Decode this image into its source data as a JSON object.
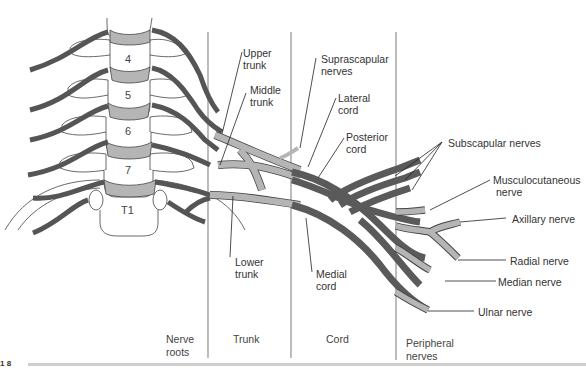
{
  "figure": {
    "number_fragment": "1  8",
    "colors": {
      "root_dark": "#555555",
      "trunk_light": "#b5b5b5",
      "cord_dark": "#5a5a5a",
      "outline": "#444444",
      "divider": "#999999"
    }
  },
  "vertebrae": [
    "4",
    "5",
    "6",
    "7",
    "T1"
  ],
  "columns": [
    {
      "line1": "Nerve",
      "line2": "roots"
    },
    {
      "line1": "Trunk",
      "line2": ""
    },
    {
      "line1": "Cord",
      "line2": ""
    },
    {
      "line1": "Peripheral",
      "line2": "nerves"
    }
  ],
  "labels": {
    "upper_trunk": {
      "line1": "Upper",
      "line2": "trunk"
    },
    "middle_trunk": {
      "line1": "Middle",
      "line2": "trunk"
    },
    "lower_trunk": {
      "line1": "Lower",
      "line2": "trunk"
    },
    "suprascapular": {
      "line1": "Suprascapular",
      "line2": "nerves"
    },
    "lateral_cord": {
      "line1": "Lateral",
      "line2": "cord"
    },
    "posterior_cord": {
      "line1": "Posterior",
      "line2": "cord"
    },
    "medial_cord": {
      "line1": "Medial",
      "line2": "cord"
    },
    "subscapular": "Subscapular nerves",
    "musculocutaneous": {
      "line1": "Musculocutaneous",
      "line2": "nerve"
    },
    "axillary": "Axillary nerve",
    "radial": "Radial nerve",
    "median": "Median nerve",
    "ulnar": "Ulnar nerve"
  }
}
